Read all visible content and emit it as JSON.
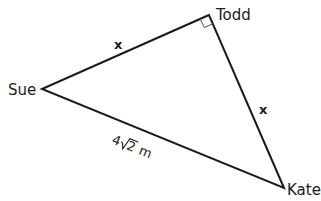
{
  "diagram": {
    "type": "right-triangle",
    "vertices": {
      "todd": {
        "label": "Todd",
        "x": 209,
        "y": 15
      },
      "sue": {
        "label": "Sue",
        "x": 42,
        "y": 89
      },
      "kate": {
        "label": "Kate",
        "x": 284,
        "y": 188
      }
    },
    "right_angle_at": "Todd",
    "sides": {
      "sue_todd": {
        "label": "x"
      },
      "todd_kate": {
        "label": "x"
      },
      "sue_kate": {
        "label_coef": "4",
        "label_radicand": "2",
        "label_unit": "m"
      }
    },
    "colors": {
      "line": "#1a1a1a",
      "background": "#ffffff"
    }
  }
}
